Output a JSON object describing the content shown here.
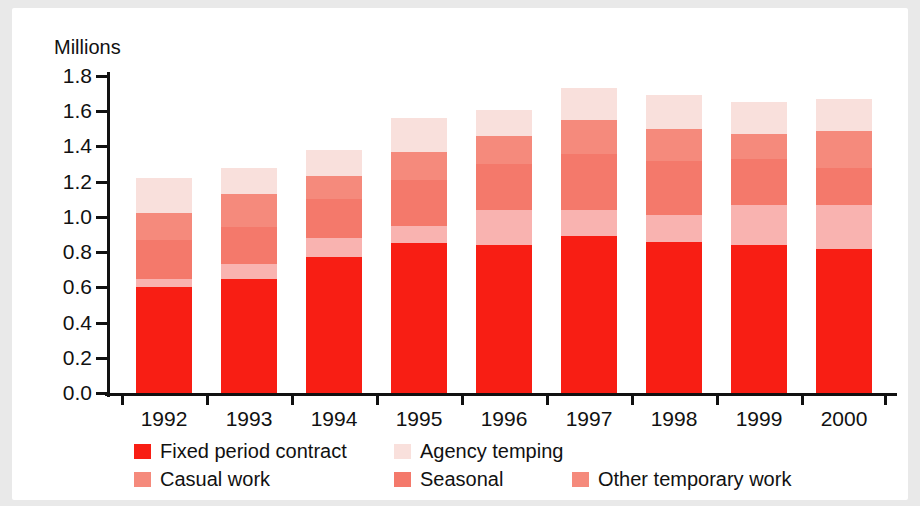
{
  "chart_data": {
    "type": "bar",
    "stacked": true,
    "title": "",
    "subtitle": "",
    "xlabel": "",
    "ylabel": "Millions",
    "ylim": [
      0.0,
      1.8
    ],
    "ytick_step": 0.2,
    "ytick_labels": [
      "1.8",
      "1.6",
      "1.4",
      "1.2",
      "1.0",
      "0.8",
      "0.6",
      "0.4",
      "0.2",
      "0.0"
    ],
    "ytick_values": [
      1.8,
      1.6,
      1.4,
      1.2,
      1.0,
      0.8,
      0.6,
      0.4,
      0.2,
      0.0
    ],
    "grid": false,
    "legend_position": "bottom",
    "categories": [
      "1992",
      "1993",
      "1994",
      "1995",
      "1996",
      "1997",
      "1998",
      "1999",
      "2000"
    ],
    "series": [
      {
        "name": "Fixed period contract",
        "color": "#f81e14",
        "values": [
          0.6,
          0.65,
          0.77,
          0.85,
          0.84,
          0.89,
          0.86,
          0.84,
          0.82
        ]
      },
      {
        "name": "Agency temping",
        "color": "#f9b3b0",
        "values": [
          0.05,
          0.08,
          0.11,
          0.1,
          0.2,
          0.15,
          0.15,
          0.23,
          0.25
        ]
      },
      {
        "name": "Casual work",
        "color": "#f4796b",
        "values": [
          0.22,
          0.21,
          0.22,
          0.26,
          0.26,
          0.32,
          0.31,
          0.26,
          0.21
        ]
      },
      {
        "name": "Seasonal",
        "color": "#f58a7c",
        "values": [
          0.15,
          0.19,
          0.13,
          0.16,
          0.16,
          0.19,
          0.18,
          0.14,
          0.21
        ]
      },
      {
        "name": "Other temporary work",
        "color": "#f9e0dc",
        "values": [
          0.2,
          0.15,
          0.15,
          0.19,
          0.15,
          0.18,
          0.19,
          0.18,
          0.18
        ]
      }
    ],
    "totals": [
      1.22,
      1.28,
      1.38,
      1.56,
      1.61,
      1.73,
      1.69,
      1.65,
      1.67
    ],
    "annotations": []
  },
  "legend": {
    "items": [
      {
        "label": "Fixed period contract",
        "color": "#f81e14"
      },
      {
        "label": "Agency temping",
        "color": "#f9e0dc"
      },
      {
        "label": "Casual work",
        "color": "#f58a7c"
      },
      {
        "label": "Seasonal",
        "color": "#f4796b"
      },
      {
        "label": "Other temporary work",
        "color": "#f58a7c"
      }
    ]
  }
}
